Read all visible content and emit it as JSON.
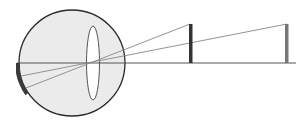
{
  "diagram": {
    "colors": {
      "eyeball_fill": "#ebebeb",
      "outline": "#2a2a2a",
      "lens_fill": "#ffffff",
      "ray": "#888888",
      "axis": "#555555",
      "retina_image": "#3a3a3a",
      "near_object": "#333333",
      "far_object": "#777777"
    },
    "elements": [
      {
        "name": "eyeball",
        "type": "circle"
      },
      {
        "name": "lens",
        "type": "ellipse"
      },
      {
        "name": "optical-axis",
        "type": "line"
      },
      {
        "name": "near-object",
        "type": "bar"
      },
      {
        "name": "far-object",
        "type": "bar"
      },
      {
        "name": "retina-image",
        "type": "arc"
      }
    ]
  }
}
